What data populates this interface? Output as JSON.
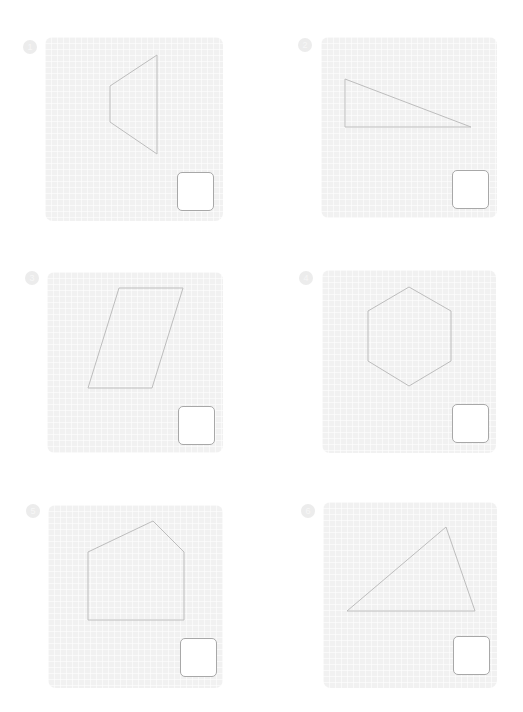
{
  "worksheet": {
    "problems": [
      {
        "number": "1",
        "shape": "trapezoid",
        "panel": {
          "x": 45,
          "y": 37,
          "w": 178,
          "h": 184
        },
        "points": "110,86 157,55 157,154 110,122",
        "answer_box": {
          "x": 177,
          "y": 172
        },
        "answer": ""
      },
      {
        "number": "2",
        "shape": "right-triangle",
        "panel": {
          "x": 321,
          "y": 37,
          "w": 176,
          "h": 181
        },
        "points": "345,79 345,127 471,127",
        "answer_box": {
          "x": 452,
          "y": 170
        },
        "answer": ""
      },
      {
        "number": "3",
        "shape": "parallelogram",
        "panel": {
          "x": 47,
          "y": 272,
          "w": 176,
          "h": 181
        },
        "points": "119,288 183,288 152,388 88,388",
        "answer_box": {
          "x": 178,
          "y": 406
        },
        "answer": ""
      },
      {
        "number": "4",
        "shape": "hexagon",
        "panel": {
          "x": 322,
          "y": 270,
          "w": 174,
          "h": 183
        },
        "points": "409,287 451,311 451,361 409,386 368,361 368,311",
        "answer_box": {
          "x": 452,
          "y": 404
        },
        "answer": ""
      },
      {
        "number": "5",
        "shape": "pentagon",
        "panel": {
          "x": 48,
          "y": 505,
          "w": 175,
          "h": 183
        },
        "points": "88,552 153,521 184,552 184,620 88,620",
        "answer_box": {
          "x": 180,
          "y": 638
        },
        "answer": ""
      },
      {
        "number": "6",
        "shape": "triangle",
        "panel": {
          "x": 323,
          "y": 502,
          "w": 174,
          "h": 186
        },
        "points": "347,611 446,527 475,611",
        "answer_box": {
          "x": 453,
          "y": 636
        },
        "answer": ""
      }
    ],
    "number_badges": [
      {
        "x": 23,
        "y": 40
      },
      {
        "x": 298,
        "y": 38
      },
      {
        "x": 25,
        "y": 271
      },
      {
        "x": 299,
        "y": 271
      },
      {
        "x": 26,
        "y": 504
      },
      {
        "x": 301,
        "y": 504
      }
    ],
    "colors": {
      "panel": "#f1f1f1",
      "shape_stroke": "#bdbdbd",
      "answer_border": "#a8a8a8"
    }
  }
}
